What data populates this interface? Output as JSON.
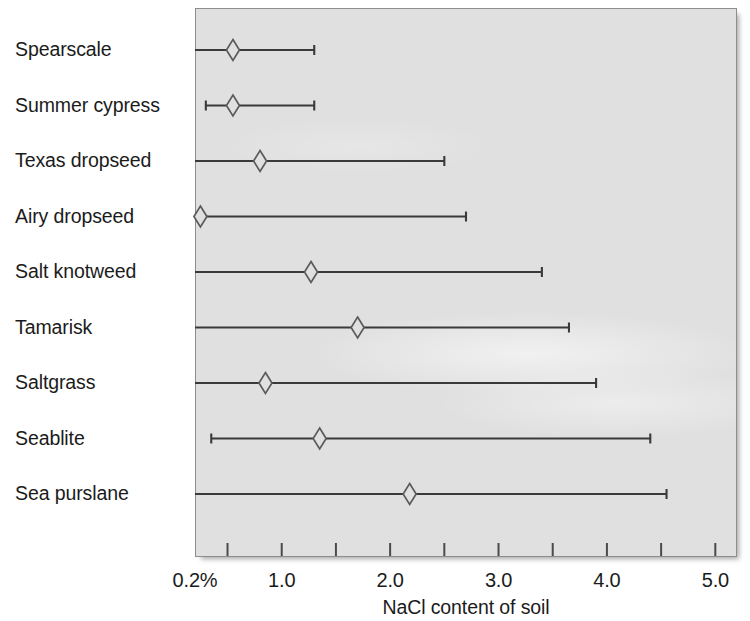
{
  "chart_data": {
    "type": "line",
    "chart_subtype": "range-plot-with-median-marker",
    "title": "",
    "xlabel": "NaCl content of soil",
    "ylabel": "",
    "xlim": [
      0.2,
      5.2
    ],
    "xticks": [
      0.2,
      1.0,
      2.0,
      3.0,
      4.0,
      5.0
    ],
    "xtick_labels": [
      "0.2%",
      "1.0",
      "2.0",
      "3.0",
      "4.0",
      "5.0"
    ],
    "minor_ticks": [
      0.5,
      1.5,
      2.5,
      3.5,
      4.5
    ],
    "grid": false,
    "legend": false,
    "categories": [
      "Spearscale",
      "Summer cypress",
      "Texas dropseed",
      "Airy dropseed",
      "Salt knotweed",
      "Tamarisk",
      "Saltgrass",
      "Seablite",
      "Sea purslane"
    ],
    "series": [
      {
        "name": "NaCl tolerance range",
        "points": [
          {
            "category": "Spearscale",
            "low": 0.2,
            "marker": 0.55,
            "high": 1.3,
            "low_cap": false,
            "high_cap": true
          },
          {
            "category": "Summer cypress",
            "low": 0.3,
            "marker": 0.55,
            "high": 1.3,
            "low_cap": true,
            "high_cap": true
          },
          {
            "category": "Texas dropseed",
            "low": 0.2,
            "marker": 0.8,
            "high": 2.5,
            "low_cap": false,
            "high_cap": true
          },
          {
            "category": "Airy dropseed",
            "low": 0.2,
            "marker": 0.25,
            "high": 2.7,
            "low_cap": false,
            "high_cap": true
          },
          {
            "category": "Salt knotweed",
            "low": 0.2,
            "marker": 1.27,
            "high": 3.4,
            "low_cap": false,
            "high_cap": true
          },
          {
            "category": "Tamarisk",
            "low": 0.2,
            "marker": 1.7,
            "high": 3.65,
            "low_cap": false,
            "high_cap": true
          },
          {
            "category": "Saltgrass",
            "low": 0.2,
            "marker": 0.85,
            "high": 3.9,
            "low_cap": false,
            "high_cap": true
          },
          {
            "category": "Seablite",
            "low": 0.35,
            "marker": 1.35,
            "high": 4.4,
            "low_cap": true,
            "high_cap": true
          },
          {
            "category": "Sea purslane",
            "low": 0.2,
            "marker": 2.18,
            "high": 4.55,
            "low_cap": false,
            "high_cap": true
          }
        ]
      }
    ],
    "colors": {
      "panel_background": "#e0e0e0",
      "panel_border": "#8d8d8d",
      "line": "#3a3a3a",
      "marker_stroke": "#5a5a5a",
      "marker_fill": "#e0e0e0",
      "text": "#1b1b1b"
    }
  },
  "axis": {
    "x_title": "NaCl content of soil"
  }
}
